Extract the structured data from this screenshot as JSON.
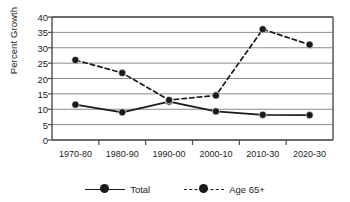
{
  "chart_data": {
    "type": "line",
    "title": "",
    "xlabel": "",
    "ylabel": "Percent Growth",
    "categories": [
      "1970-80",
      "1980-90",
      "1990-00",
      "2000-10",
      "2010-30",
      "2020-30"
    ],
    "ylim": [
      0,
      40
    ],
    "ytick_step": 5,
    "yticks": [
      "0",
      "5",
      "10",
      "15",
      "20",
      "25",
      "30",
      "35",
      "40"
    ],
    "grid": true,
    "grid_axis": "y",
    "legend_position": "bottom",
    "series": [
      {
        "name": "Total",
        "linestyle": "solid",
        "marker": "circle",
        "color": "#1a1a1a",
        "values": [
          11.5,
          9.0,
          12.5,
          9.3,
          8.2,
          8.1
        ]
      },
      {
        "name": "Age 65+",
        "linestyle": "dashed",
        "marker": "circle",
        "color": "#1a1a1a",
        "values": [
          26.0,
          21.8,
          13.0,
          14.5,
          36.0,
          31.0
        ]
      }
    ]
  },
  "legend": {
    "items": [
      {
        "label": "Total"
      },
      {
        "label": "Age 65+"
      }
    ]
  },
  "colors": {
    "line": "#1a1a1a",
    "grid": "#8c8c8c",
    "frame": "#4d4d4d",
    "text": "#1d1d1d",
    "background": "#ffffff"
  }
}
